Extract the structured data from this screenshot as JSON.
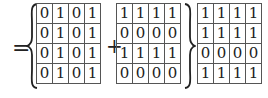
{
  "equation": {
    "equals_sign": "=",
    "plus_sign": "+",
    "matrix_a": [
      [
        "0",
        "1",
        "0",
        "1"
      ],
      [
        "0",
        "1",
        "0",
        "1"
      ],
      [
        "0",
        "1",
        "0",
        "1"
      ],
      [
        "0",
        "1",
        "0",
        "1"
      ]
    ],
    "matrix_b": [
      [
        "1",
        "1",
        "1",
        "1"
      ],
      [
        "0",
        "0",
        "0",
        "0"
      ],
      [
        "1",
        "1",
        "1",
        "1"
      ],
      [
        "0",
        "0",
        "0",
        "0"
      ]
    ],
    "matrix_result": [
      [
        "1",
        "1",
        "1",
        "1"
      ],
      [
        "1",
        "1",
        "1",
        "1"
      ],
      [
        "0",
        "0",
        "0",
        "0"
      ],
      [
        "1",
        "1",
        "1",
        "1"
      ]
    ]
  }
}
